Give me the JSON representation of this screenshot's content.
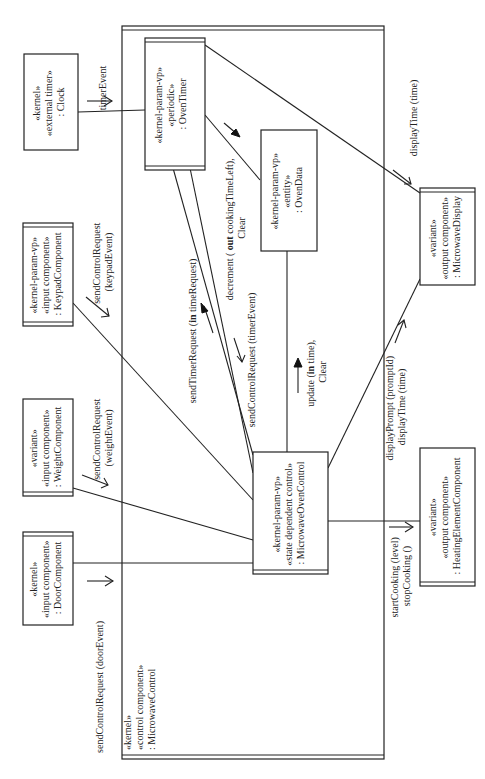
{
  "diagram": {
    "container": {
      "stereotypes": [
        "«kernel»",
        "«control component»"
      ],
      "name": ": MicrowaveControl"
    },
    "components": {
      "clock": {
        "lines": [
          "«kernel»",
          "«external timer»",
          ": Clock"
        ]
      },
      "keypad": {
        "lines": [
          "«kernel-param-vp»",
          "«input component»",
          ": KeypadComponent"
        ]
      },
      "weight": {
        "lines": [
          "«variant»",
          "«input component»",
          ": WeightComponent"
        ]
      },
      "door": {
        "lines": [
          "«kernel»",
          "«input component»",
          ": DoorComponent"
        ]
      },
      "oven_timer": {
        "lines": [
          "«kernel-param-vp»",
          "«periodic»",
          ": OvenTimer"
        ]
      },
      "oven_data": {
        "lines": [
          "«kernel-param-vp»",
          "«entity»",
          ": OvenData"
        ]
      },
      "oven_control": {
        "lines": [
          "«kernel-param-vp»",
          "«state dependent  control»",
          ": MicrowaveOvenControl"
        ]
      },
      "display": {
        "lines": [
          "«variant»",
          "«output component»",
          ": MicrowaveDisplay"
        ]
      },
      "heating": {
        "lines": [
          "«variant»",
          "«output component»",
          ": HeatingElementComponent"
        ]
      }
    },
    "messages": {
      "timer_event": "timerEvent",
      "keypad_req": [
        "sendControlRequest",
        "(keypadEvent)"
      ],
      "weight_req": [
        "sendControlRequest",
        "(weightEvent)"
      ],
      "door_req": "sendControlRequest (doorEvent)",
      "timer_request": {
        "pre": "sendTimerRequest (",
        "kw": "in",
        "post": " timeRequest)"
      },
      "timer_ctrl_req": "sendControlRequest (timerEvent)",
      "decrement": {
        "pre": "decrement ( ",
        "kw": "out",
        "post": " cookingTimeLeft),",
        "line2": "Clear"
      },
      "update": {
        "pre": "update (",
        "kw": "in",
        "post": " time),",
        "line2": "Clear"
      },
      "display_time_top": "displayTime (time)",
      "display_prompt": [
        "displayPrompt (promptId)",
        "displayTime (time)"
      ],
      "cooking": [
        "startCooking (level)",
        "stopCooking ()"
      ]
    }
  }
}
